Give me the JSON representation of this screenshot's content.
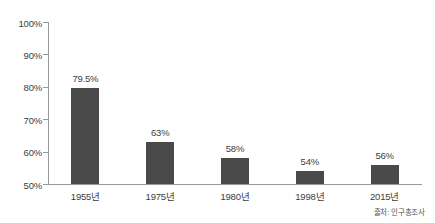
{
  "chart_data": {
    "type": "bar",
    "title": "",
    "subtitle": "",
    "xlabel": "",
    "ylabel": "",
    "categories": [
      "1955년",
      "1975년",
      "1980년",
      "1998년",
      "2015년"
    ],
    "values": [
      79.5,
      63,
      58,
      54,
      56
    ],
    "value_labels": [
      "79.5%",
      "63%",
      "58%",
      "54%",
      "56%"
    ],
    "ylim": [
      50,
      100
    ],
    "ytick_values": [
      100,
      90,
      80,
      70,
      60,
      50
    ],
    "ytick_labels": [
      "100%",
      "90%",
      "80%",
      "70%",
      "60%",
      "50%"
    ],
    "grid": false,
    "legend": false,
    "bar_color": "#4a4a4a",
    "axis_color": "#9a9a9a",
    "background_color": "#ffffff"
  },
  "annotations": {
    "source_note": "출처: 인구총조사"
  }
}
